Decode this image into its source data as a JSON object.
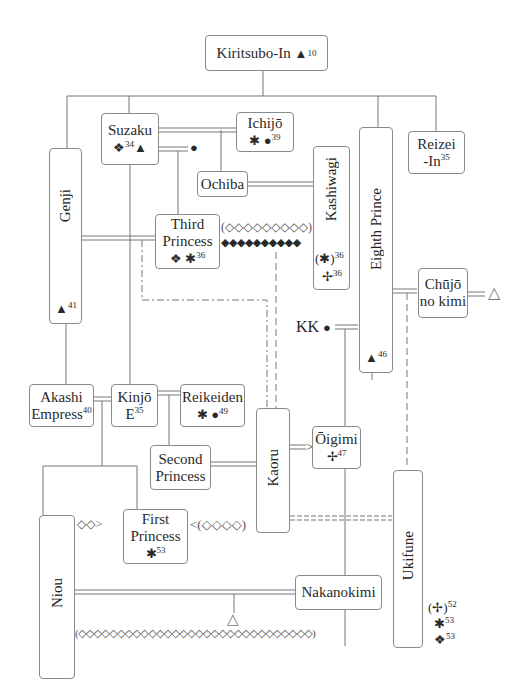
{
  "diagram": {
    "nodes": {
      "kiritsubo": {
        "name": "Kiritsubo-In",
        "symbol": "▲",
        "sup": "10"
      },
      "suzaku": {
        "name": "Suzaku",
        "symbol1": "❖",
        "sup": "34",
        "symbol2": "▲"
      },
      "ichijo": {
        "name": "Ichijō",
        "symbol1": "✱",
        "symbol2": "●",
        "sup": "39"
      },
      "reizei": {
        "line1": "Reizei",
        "line2": "-In",
        "sup": "35"
      },
      "genji": {
        "name": "Genji",
        "symbol": "▲",
        "sup": "41"
      },
      "ochiba": {
        "name": "Ochiba"
      },
      "third_princess": {
        "line1": "Third",
        "line2": "Princess",
        "symbol1": "❖",
        "symbol2": "✱",
        "sup": "36"
      },
      "kashiwagi": {
        "name": "Kashiwagi",
        "symbol1": "(✱)",
        "sup1": "36",
        "symbol2": "✢",
        "sup2": "36"
      },
      "eighth_prince": {
        "name": "Eighth Prince",
        "symbol": "▲",
        "sup": "46"
      },
      "chujo": {
        "line1": "Chūjō",
        "line2": "no kimi"
      },
      "kk": {
        "name": "KK",
        "symbol": "●"
      },
      "akashi": {
        "line1": "Akashi",
        "line2": "Empress",
        "sup": "40"
      },
      "kinjo": {
        "line1": "Kinjō",
        "line2": "E",
        "sup": "35"
      },
      "reikeiden": {
        "name": "Reikeiden",
        "symbol1": "✱",
        "symbol2": "●",
        "sup": "49"
      },
      "second_princess": {
        "line1": "Second",
        "line2": "Princess"
      },
      "kaoru": {
        "name": "Kaoru"
      },
      "oigimi": {
        "name": "Ōigimi",
        "symbol": "✢",
        "sup": "47"
      },
      "niou": {
        "name": "Niou"
      },
      "first_princess": {
        "line1": "First",
        "line2": "Princess",
        "symbol": "✱",
        "sup": "53"
      },
      "nakanokimi": {
        "name": "Nakanokimi"
      },
      "ukifune": {
        "name": "Ukifune",
        "symbol1": "(✢)",
        "sup1": "52",
        "symbol2": "✱",
        "sup2": "53",
        "symbol3": "❖",
        "sup3": "53"
      }
    },
    "annotations": {
      "suzaku_ichijo_dot": "●",
      "third_princess_kashiwagi_open": "(◇◇◇◇◇◇◇◇◇)",
      "third_princess_kashiwagi_solid": "◆◆◆◆◆◆◆◆◆◆",
      "niou_first_princess": "◇◇>",
      "kaoru_first_princess": "<(◇◇◇◇)",
      "kaoru_oigimi_arrow": ">",
      "chujo_child": "△",
      "niou_nakanokimi_child": "△",
      "bottom_longing": "(◇◇◇◇◇◇◇◇◇◇◇◇◇◇◇◇◇◇◇◇◇◇◇◇◇◇◇◇◇◇)"
    },
    "colors": {
      "line": "#777777",
      "border": "#8a8a8a",
      "text": "#2a2a2a",
      "background": "#ffffff"
    }
  }
}
